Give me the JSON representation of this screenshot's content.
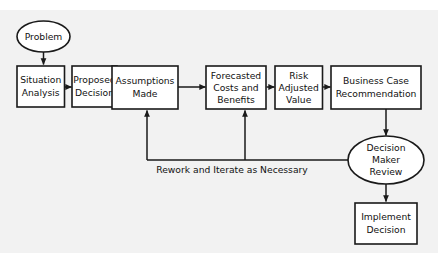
{
  "diagram": {
    "background_color": "#f2f2f2",
    "node_fill": "#ffffff",
    "stroke_color": "#1a1a1a",
    "nodes": [
      {
        "id": "problem",
        "shape": "ellipse",
        "lines": [
          "Problem"
        ]
      },
      {
        "id": "situation",
        "shape": "rect",
        "lines": [
          "Situation",
          "Analysis"
        ]
      },
      {
        "id": "proposed",
        "shape": "rect",
        "lines": [
          "Proposed",
          "Decision"
        ]
      },
      {
        "id": "assumptions",
        "shape": "rect",
        "lines": [
          "Assumptions",
          "Made"
        ]
      },
      {
        "id": "forecasted",
        "shape": "rect",
        "lines": [
          "Forecasted",
          "Costs and",
          "Benefits"
        ]
      },
      {
        "id": "risk",
        "shape": "rect",
        "lines": [
          "Risk",
          "Adjusted",
          "Value"
        ]
      },
      {
        "id": "businesscase",
        "shape": "rect",
        "lines": [
          "Business Case",
          "Recommendation"
        ]
      },
      {
        "id": "decisionmaker",
        "shape": "ellipse",
        "lines": [
          "Decision",
          "Maker",
          "Review"
        ]
      },
      {
        "id": "implement",
        "shape": "rect",
        "lines": [
          "Implement",
          "Decision"
        ]
      }
    ],
    "edge_labels": [
      {
        "id": "rework",
        "text": "Rework and Iterate as Necessary"
      }
    ]
  }
}
